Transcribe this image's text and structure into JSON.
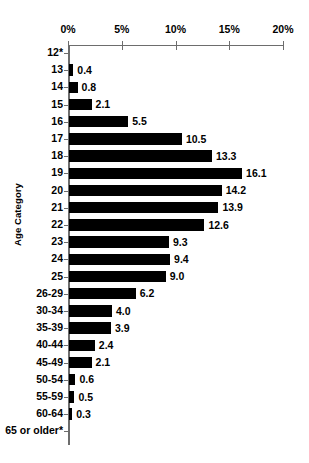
{
  "chart_data": {
    "type": "bar",
    "orientation": "horizontal",
    "title": "",
    "subtitle": "",
    "xlabel": "",
    "ylabel": "Age Category",
    "xlim": [
      0,
      20
    ],
    "xunit": "%",
    "grid": false,
    "legend": null,
    "axis_top": true,
    "bar_color": "#000000",
    "axis_color": "#6d6d6d",
    "xticks": [
      0,
      5,
      10,
      15,
      20
    ],
    "xtick_labels": [
      "0%",
      "5%",
      "10%",
      "15%",
      "20%"
    ],
    "categories": [
      "12*",
      "13",
      "14",
      "15",
      "16",
      "17",
      "18",
      "19",
      "20",
      "21",
      "22",
      "23",
      "24",
      "25",
      "26-29",
      "30-34",
      "35-39",
      "40-44",
      "45-49",
      "50-54",
      "55-59",
      "60-64",
      "65 or older*"
    ],
    "values": [
      null,
      0.4,
      0.8,
      2.1,
      5.5,
      10.5,
      13.3,
      16.1,
      14.2,
      13.9,
      12.6,
      9.3,
      9.4,
      9.0,
      6.2,
      4.0,
      3.9,
      2.4,
      2.1,
      0.6,
      0.5,
      0.3,
      null
    ],
    "value_labels": [
      "",
      "0.4",
      "0.8",
      "2.1",
      "5.5",
      "10.5",
      "13.3",
      "16.1",
      "14.2",
      "13.9",
      "12.6",
      "9.3",
      "9.4",
      "9.0",
      "6.2",
      "4.0",
      "3.9",
      "2.4",
      "2.1",
      "0.6",
      "0.5",
      "0.3",
      ""
    ],
    "annotations": [
      "* denotes suppressed or not-reported value for 12* and 65 or older*"
    ]
  }
}
